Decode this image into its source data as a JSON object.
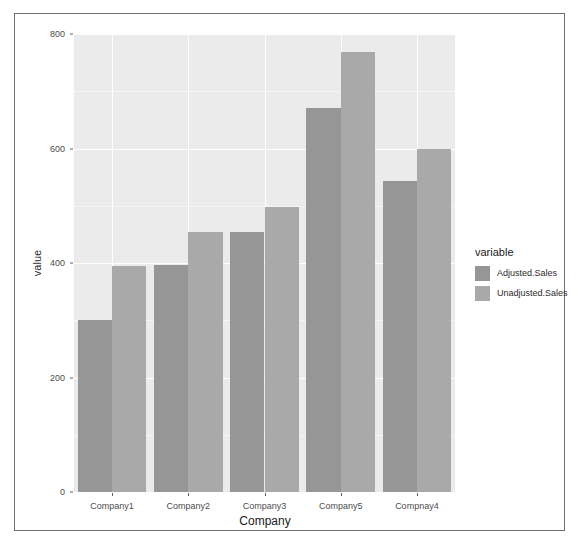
{
  "chart_data": {
    "type": "bar",
    "title": "",
    "subtitle": "",
    "xlabel": "Company",
    "ylabel": "value",
    "categories": [
      "Company1",
      "Company2",
      "Company3",
      "Company5",
      "Compnay4"
    ],
    "series": [
      {
        "name": "Adjusted.Sales",
        "values": [
          300,
          396,
          454,
          671,
          544
        ],
        "color": "#969696"
      },
      {
        "name": "Unadjusted.Sales",
        "values": [
          394,
          454,
          498,
          768,
          599
        ],
        "color": "#a9a9a9"
      }
    ],
    "ylim": [
      0,
      800
    ],
    "y_ticks": [
      0,
      200,
      400,
      600,
      800
    ],
    "y_tick_labels": [
      "0",
      "200",
      "400",
      "600",
      "800"
    ],
    "y_minor_ticks": [
      100,
      300,
      500,
      700
    ],
    "grid": true,
    "legend": {
      "title": "variable",
      "position": "right",
      "entries": [
        "Adjusted.Sales",
        "Unadjusted.Sales"
      ]
    },
    "style": {
      "panel_background": "#ebebeb",
      "major_gridline_color": "#ffffff",
      "minor_gridline_color": "#f5f5f5",
      "axis_text_color": "#4d4d4d",
      "frame_color": "#6f6f6f",
      "figure_background": "#ffffff"
    }
  }
}
